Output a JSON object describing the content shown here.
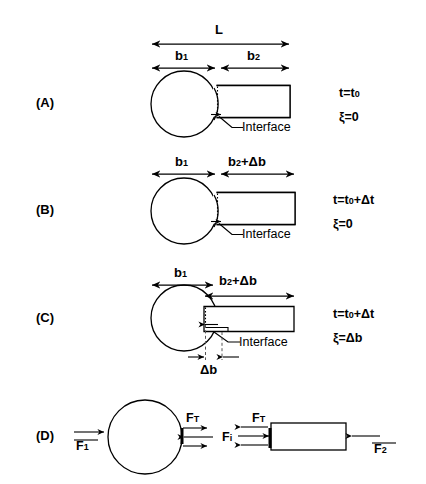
{
  "figure": {
    "background_color": "#ffffff",
    "line_color": "#000000"
  },
  "panels": [
    {
      "letter": "(A)",
      "dimensions": [
        {
          "name": "L",
          "label": "L"
        },
        {
          "name": "b1",
          "label": "b",
          "subscript": "1"
        },
        {
          "name": "b2",
          "label": "b",
          "subscript": "2"
        }
      ],
      "callout": "Interface",
      "state": {
        "time": "t=t",
        "time_sub": "0",
        "time_extra": "",
        "displacement": "ξ=0"
      }
    },
    {
      "letter": "(B)",
      "dimensions": [
        {
          "name": "b1",
          "label": "b",
          "subscript": "1"
        },
        {
          "name": "b2db",
          "label": "b",
          "subscript": "2",
          "suffix": "+Δb"
        }
      ],
      "callout": "Interface",
      "state": {
        "time": "t=t",
        "time_sub": "0",
        "time_extra": "+Δt",
        "displacement": "ξ=0"
      }
    },
    {
      "letter": "(C)",
      "dimensions": [
        {
          "name": "b1",
          "label": "b",
          "subscript": "1"
        },
        {
          "name": "b2db",
          "label": "b",
          "subscript": "2",
          "suffix": "+Δb"
        },
        {
          "name": "db",
          "label": "Δb"
        }
      ],
      "callout": "Interface",
      "state": {
        "time": "t=t",
        "time_sub": "0",
        "time_extra": "+Δt",
        "displacement": "ξ=Δb"
      }
    },
    {
      "letter": "(D)",
      "forces": [
        {
          "name": "F1",
          "label": "F",
          "subscript": "1",
          "overbar": true,
          "direction": "right"
        },
        {
          "name": "FT-left",
          "label": "F",
          "subscript": "T",
          "overbar": false,
          "direction": "pair"
        },
        {
          "name": "Fi",
          "label": "F",
          "subscript": "i",
          "overbar": false,
          "direction": "none"
        },
        {
          "name": "FT-right",
          "label": "F",
          "subscript": "T",
          "overbar": false,
          "direction": "pair"
        },
        {
          "name": "F2",
          "label": "F",
          "subscript": "2",
          "overbar": true,
          "direction": "left"
        }
      ]
    }
  ],
  "text": {
    "interface": "Interface",
    "L": "L",
    "b": "b",
    "delta_b": "Δb",
    "delta_t": "Δt",
    "xi": "ξ",
    "F": "F"
  }
}
